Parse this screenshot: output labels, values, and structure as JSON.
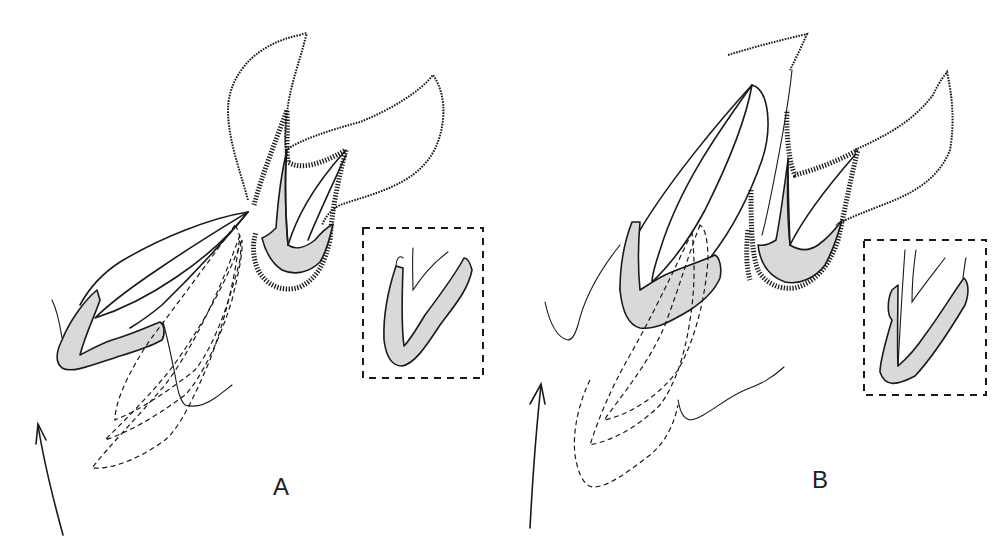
{
  "figure": {
    "panels": [
      {
        "id": "A",
        "label": "A"
      },
      {
        "id": "B",
        "label": "B"
      }
    ],
    "colors": {
      "line": "#1a1a1a",
      "shading": "#d9d9d9",
      "background": "#ffffff"
    }
  }
}
